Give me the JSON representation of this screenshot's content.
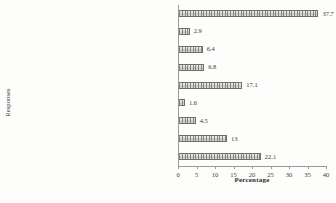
{
  "chart_data": {
    "type": "bar",
    "orientation": "horizontal",
    "title": "",
    "xlabel": "Percentage",
    "ylabel": "Responses",
    "xlim": [
      0,
      40
    ],
    "xticks": [
      0,
      5,
      10,
      15,
      20,
      25,
      30,
      35,
      40
    ],
    "grid": false,
    "legend": false,
    "categories": [
      "Nothing",
      "Bodily integrity [due to rape/sexual abuse]",
      "Property: vehicle/bicycle",
      "Livelihood: Job/employment",
      "Friendships (i.e due to ruptured social...",
      "Education (had to leave school entirely)",
      "Education ( time off school)",
      "Livelihood (for those in business)",
      "Property: Home/ personal belongings"
    ],
    "values": [
      37.7,
      2.9,
      6.4,
      6.8,
      17.1,
      1.6,
      4.5,
      13,
      22.1
    ],
    "value_labels": [
      "37.7",
      "2.9",
      "6.4",
      "6.8",
      "17.1",
      "1.6",
      "4.5",
      "13",
      "22.1"
    ],
    "bar_color": "#d8d8d4",
    "bar_edge_color": "#6d6d6a",
    "axis_color": "#9a9a96",
    "text_color": "#3b3b3b",
    "background": "#fdfdfc"
  },
  "caption": {
    "partial_text": ""
  }
}
